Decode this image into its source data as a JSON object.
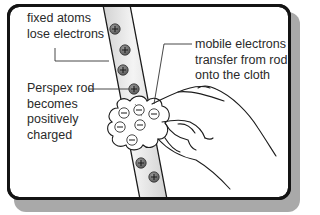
{
  "figure": {
    "labels": {
      "fixed_atoms": [
        "fixed atoms",
        "lose electrons"
      ],
      "mobile_electrons": [
        "mobile electrons",
        "transfer from rod",
        "onto the cloth"
      ],
      "rod_charged": [
        "Perspex rod",
        "becomes",
        "positively",
        "charged"
      ]
    },
    "symbols": {
      "positive_charge": "+",
      "negative_charge": "−"
    },
    "counts": {
      "positive_charges_on_rod": 6,
      "negative_charges_on_cloth": 6
    },
    "colors": {
      "frame_border": "#141414",
      "frame_shadow": "#a9a9a9",
      "rod_fill": "#e4e4e4",
      "positive_fill": "#6b6b6b",
      "cloth_fill": "#ffffff",
      "text": "#2a2a2a"
    }
  }
}
